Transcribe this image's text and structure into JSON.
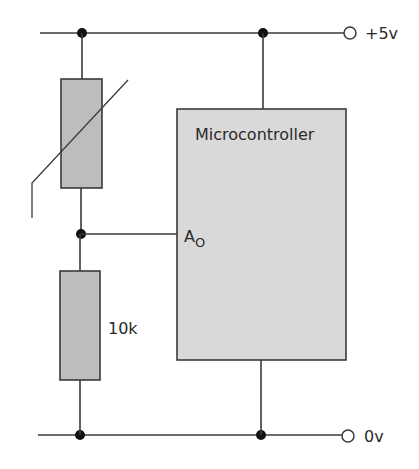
{
  "diagram": {
    "type": "circuit-schematic",
    "colors": {
      "wire": "#3a3a3a",
      "resistor_fill": "#bdbdbd",
      "microcontroller_fill": "#d9d9d9",
      "text": "#2a2a2a",
      "background": "#ffffff"
    },
    "labels": {
      "supply_positive": "+5v",
      "supply_ground": "0v",
      "microcontroller": "Microcontroller",
      "analog_input_main": "A",
      "analog_input_sub": "O",
      "fixed_resistor_value": "10k"
    },
    "components": [
      {
        "id": "thermistor",
        "kind": "thermistor",
        "connects": [
          "+5v rail",
          "divider node"
        ]
      },
      {
        "id": "r1",
        "kind": "resistor",
        "value": "10k",
        "connects": [
          "divider node",
          "0v rail"
        ]
      },
      {
        "id": "mcu",
        "kind": "microcontroller",
        "label": "Microcontroller",
        "pins": [
          "Vcc",
          "A0",
          "GND"
        ]
      }
    ],
    "nodes": [
      "+5v rail",
      "divider node",
      "0v rail"
    ]
  }
}
